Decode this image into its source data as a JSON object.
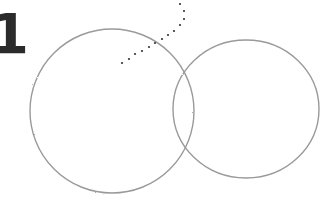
{
  "step": {
    "number": "1"
  },
  "diagram": {
    "type": "venn-sketch",
    "stroke_color": "#9a9a9a",
    "dot_color": "#333333",
    "circles": [
      {
        "name": "left-circle",
        "cx": 112,
        "cy": 111,
        "rx": 82,
        "ry": 82
      },
      {
        "name": "right-circle",
        "cx": 246,
        "cy": 109,
        "rx": 73,
        "ry": 69
      }
    ],
    "dotted_line": [
      [
        180,
        4
      ],
      [
        184,
        11
      ],
      [
        184,
        19
      ],
      [
        180,
        25
      ],
      [
        174,
        31
      ],
      [
        168,
        35
      ],
      [
        162,
        39
      ],
      [
        155,
        43
      ],
      [
        149,
        47
      ],
      [
        142,
        51
      ],
      [
        135,
        54
      ],
      [
        129,
        59
      ],
      [
        122,
        63
      ]
    ]
  }
}
